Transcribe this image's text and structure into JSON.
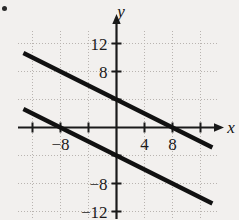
{
  "figure": {
    "bullet_marker": "•",
    "background_color": "#f2f0ee",
    "line_color": "#111111",
    "grid_color": "#b9b4b0",
    "axis_color": "#1a1a1a"
  },
  "axis_labels": {
    "x": "x",
    "y": "y"
  },
  "chart_data": {
    "type": "line",
    "title": "",
    "subtitle": "",
    "xlabel": "x",
    "ylabel": "y",
    "xlim": [
      -14,
      14
    ],
    "ylim": [
      -14,
      14
    ],
    "grid": true,
    "grid_spacing": 4,
    "legend": "none",
    "x_ticks": [
      -12,
      -8,
      -4,
      4,
      8,
      12
    ],
    "x_tick_labels": [
      "",
      "−8",
      "",
      "4",
      "8",
      ""
    ],
    "y_ticks": [
      -12,
      -8,
      -4,
      4,
      8,
      12
    ],
    "y_tick_labels": [
      "−12",
      "−8",
      "",
      "",
      "8",
      "12"
    ],
    "series": [
      {
        "name": "upper-line",
        "slope": -0.5,
        "intercept": 4,
        "x_intercept": 8,
        "points": [
          [
            -13.3,
            10.65
          ],
          [
            13.7,
            -2.85
          ]
        ],
        "equation": "y = -0.5x + 4"
      },
      {
        "name": "lower-line",
        "slope": -0.5,
        "intercept": -4,
        "x_intercept": -8,
        "points": [
          [
            -13.3,
            2.65
          ],
          [
            13.7,
            -10.85
          ]
        ],
        "equation": "y = -0.5x - 4"
      }
    ],
    "annotations": []
  }
}
